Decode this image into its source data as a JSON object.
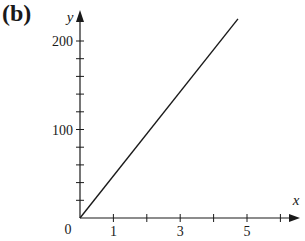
{
  "panel_label": "(b)",
  "chart_data": {
    "type": "line",
    "title": "",
    "xlabel": "x",
    "ylabel": "y",
    "origin_label": "0",
    "xlim": [
      0,
      6.5
    ],
    "ylim": [
      0,
      225
    ],
    "x_ticks": [
      1,
      2,
      3,
      4,
      5,
      6
    ],
    "x_tick_labels": [
      "1",
      "",
      "3",
      "",
      "5",
      ""
    ],
    "y_ticks": [
      20,
      40,
      60,
      80,
      100,
      120,
      140,
      160,
      180,
      200
    ],
    "y_tick_labels": [
      "",
      "",
      "",
      "",
      "100",
      "",
      "",
      "",
      "",
      "200"
    ],
    "grid": false,
    "legend": null,
    "series": [
      {
        "name": "y = kx",
        "x": [
          0,
          4.73
        ],
        "y": [
          0,
          225
        ]
      }
    ]
  }
}
